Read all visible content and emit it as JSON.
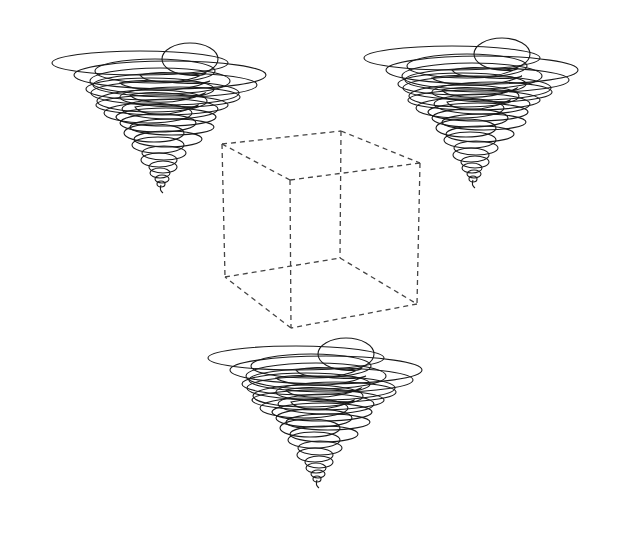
{
  "diagram": {
    "background": "#ffffff",
    "cube": {
      "stroke_color": "#444444",
      "style": "dashed",
      "vertices": {
        "top_back_left": [
          222,
          144
        ],
        "top_front_left": [
          290,
          180
        ],
        "top_back_right": [
          341,
          131
        ],
        "top_front_right": [
          420,
          163
        ],
        "bottom_back_left": [
          225,
          277
        ],
        "bottom_front_left": [
          291,
          328
        ],
        "bottom_back_right": [
          340,
          258
        ],
        "bottom_front_right": [
          417,
          304
        ]
      }
    },
    "tornadoes": [
      {
        "name": "top-left",
        "center_x": 160,
        "top_y": 45,
        "tip": [
          163,
          192
        ]
      },
      {
        "name": "top-right",
        "center_x": 472,
        "top_y": 40,
        "tip": [
          475,
          184
        ]
      },
      {
        "name": "bottom",
        "center_x": 316,
        "top_y": 340,
        "tip": [
          319,
          486
        ]
      }
    ],
    "stroke_color": "#1a1a1a"
  }
}
